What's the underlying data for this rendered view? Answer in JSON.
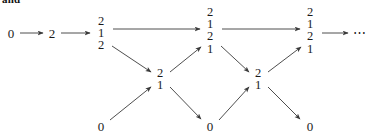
{
  "caption": {
    "text": "and"
  },
  "figure": {
    "stroke_color": "#3a3a3a",
    "text_color": "#1a1a1a",
    "background_color": "#ffffff",
    "ellipsis": "⋯"
  },
  "nodes": [
    {
      "id": "n0",
      "label": "0",
      "row": "top",
      "x": 11,
      "y": 33
    },
    {
      "id": "n1",
      "label": "2",
      "row": "top",
      "x": 52,
      "y": 33
    },
    {
      "id": "n2",
      "label": "2\n1\n2",
      "row": "top",
      "x": 101,
      "y": 33
    },
    {
      "id": "n3",
      "label": "2\n1\n2\n1",
      "row": "top",
      "x": 210,
      "y": 30
    },
    {
      "id": "n4",
      "label": "2\n1\n2\n1",
      "row": "top",
      "x": 310,
      "y": 30
    },
    {
      "id": "m0",
      "label": "2\n1",
      "row": "middle",
      "x": 160,
      "y": 79
    },
    {
      "id": "m1",
      "label": "2\n1",
      "row": "middle",
      "x": 258,
      "y": 79
    },
    {
      "id": "b0",
      "label": "0",
      "row": "bottom",
      "x": 101,
      "y": 126
    },
    {
      "id": "b1",
      "label": "0",
      "row": "bottom",
      "x": 210,
      "y": 126
    },
    {
      "id": "b2",
      "label": "0",
      "row": "bottom",
      "x": 310,
      "y": 126
    }
  ],
  "edges": [
    {
      "from": "n0",
      "to": "n1",
      "x1": 20,
      "y1": 33,
      "x2": 43,
      "y2": 33
    },
    {
      "from": "n1",
      "to": "n2",
      "x1": 61,
      "y1": 33,
      "x2": 90,
      "y2": 33
    },
    {
      "from": "n2",
      "to": "n3",
      "x1": 113,
      "y1": 29,
      "x2": 200,
      "y2": 29
    },
    {
      "from": "n3",
      "to": "n4",
      "x1": 222,
      "y1": 29,
      "x2": 300,
      "y2": 29
    },
    {
      "from": "n4",
      "to": "dots",
      "x1": 322,
      "y1": 33,
      "x2": 348,
      "y2": 33
    },
    {
      "from": "n2",
      "to": "m0",
      "x1": 112,
      "y1": 46,
      "x2": 151,
      "y2": 72
    },
    {
      "from": "b0",
      "to": "m0",
      "x1": 110,
      "y1": 120,
      "x2": 151,
      "y2": 87
    },
    {
      "from": "m0",
      "to": "n3",
      "x1": 170,
      "y1": 72,
      "x2": 201,
      "y2": 47
    },
    {
      "from": "m0",
      "to": "b1",
      "x1": 170,
      "y1": 87,
      "x2": 201,
      "y2": 119
    },
    {
      "from": "n3",
      "to": "m1",
      "x1": 221,
      "y1": 46,
      "x2": 249,
      "y2": 72
    },
    {
      "from": "b1",
      "to": "m1",
      "x1": 219,
      "y1": 120,
      "x2": 249,
      "y2": 87
    },
    {
      "from": "m1",
      "to": "n4",
      "x1": 268,
      "y1": 72,
      "x2": 301,
      "y2": 47
    },
    {
      "from": "m1",
      "to": "b2",
      "x1": 268,
      "y1": 87,
      "x2": 300,
      "y2": 119
    }
  ],
  "ellipsis_marker": {
    "x": 360,
    "y": 33
  }
}
